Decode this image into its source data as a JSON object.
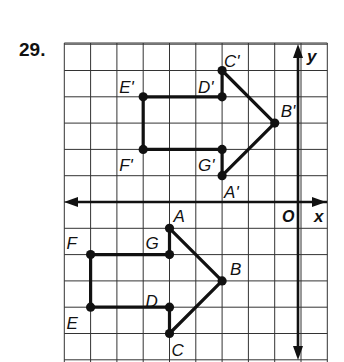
{
  "problem": {
    "number": "29."
  },
  "axes": {
    "x_label": "x",
    "y_label": "y",
    "origin_label": "O"
  },
  "grid": {
    "x_min": -9,
    "x_max": 1,
    "y_min": -6,
    "y_max": 6,
    "origin_px": [
      301,
      202
    ],
    "unit_px": 26.3,
    "line_color": "#333333",
    "figure_color": "#111111"
  },
  "figures": [
    {
      "name": "original",
      "vertices": [
        {
          "label": "A",
          "x": -5,
          "y": -1
        },
        {
          "label": "B",
          "x": -3,
          "y": -3
        },
        {
          "label": "C",
          "x": -5,
          "y": -5
        },
        {
          "label": "D",
          "x": -5,
          "y": -4
        },
        {
          "label": "E",
          "x": -8,
          "y": -4
        },
        {
          "label": "F",
          "x": -8,
          "y": -2
        },
        {
          "label": "G",
          "x": -5,
          "y": -2
        }
      ]
    },
    {
      "name": "image",
      "vertices": [
        {
          "label": "A'",
          "x": -3,
          "y": 1
        },
        {
          "label": "B'",
          "x": -1,
          "y": 3
        },
        {
          "label": "C'",
          "x": -3,
          "y": 5
        },
        {
          "label": "D'",
          "x": -3,
          "y": 4
        },
        {
          "label": "E'",
          "x": -6,
          "y": 4
        },
        {
          "label": "F'",
          "x": -6,
          "y": 2
        },
        {
          "label": "G'",
          "x": -3,
          "y": 2
        }
      ]
    }
  ]
}
